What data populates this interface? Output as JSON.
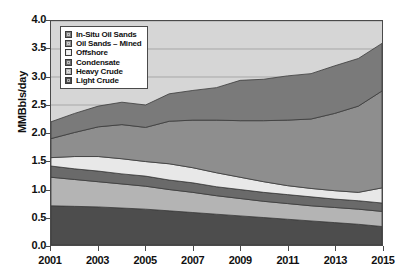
{
  "chart_data": {
    "type": "area",
    "title": "",
    "subtitle": "",
    "xlabel": "",
    "ylabel": "MMBbls/day",
    "stacked": true,
    "grid": true,
    "legend_position": "top-left",
    "xlim": [
      2001,
      2015
    ],
    "ylim": [
      0.0,
      4.0
    ],
    "yticks": [
      "0.0",
      "0.5",
      "1.0",
      "1.5",
      "2.0",
      "2.5",
      "3.0",
      "3.5",
      "4.0"
    ],
    "ytick_values": [
      0.0,
      0.5,
      1.0,
      1.5,
      2.0,
      2.5,
      3.0,
      3.5,
      4.0
    ],
    "x": [
      2001,
      2002,
      2003,
      2004,
      2005,
      2006,
      2007,
      2008,
      2009,
      2010,
      2011,
      2012,
      2013,
      2014,
      2015
    ],
    "xtick_labels": [
      "2001",
      "2003",
      "2005",
      "2007",
      "2009",
      "2011",
      "2013",
      "2015"
    ],
    "xtick_values": [
      2001,
      2003,
      2005,
      2007,
      2009,
      2011,
      2013,
      2015
    ],
    "series": [
      {
        "name": "Light Crude",
        "color": "#4d4d4d",
        "values": [
          0.7,
          0.69,
          0.68,
          0.66,
          0.64,
          0.61,
          0.58,
          0.55,
          0.52,
          0.49,
          0.46,
          0.43,
          0.4,
          0.37,
          0.33
        ]
      },
      {
        "name": "Heavy Crude",
        "color": "#b4b4b4",
        "values": [
          0.51,
          0.48,
          0.45,
          0.43,
          0.41,
          0.38,
          0.36,
          0.33,
          0.31,
          0.29,
          0.28,
          0.27,
          0.27,
          0.27,
          0.27
        ]
      },
      {
        "name": "Condensate",
        "color": "#6a6a6a",
        "values": [
          0.2,
          0.19,
          0.19,
          0.18,
          0.18,
          0.17,
          0.17,
          0.16,
          0.16,
          0.16,
          0.16,
          0.16,
          0.15,
          0.15,
          0.15
        ]
      },
      {
        "name": "Offshore",
        "color": "#e8e8e8",
        "values": [
          0.15,
          0.22,
          0.26,
          0.27,
          0.26,
          0.29,
          0.27,
          0.25,
          0.22,
          0.19,
          0.16,
          0.15,
          0.15,
          0.15,
          0.27
        ]
      },
      {
        "name": "Oil Sands – Mined",
        "color": "#8e8e8e",
        "values": [
          0.34,
          0.43,
          0.53,
          0.61,
          0.61,
          0.76,
          0.85,
          0.94,
          1.01,
          1.09,
          1.17,
          1.24,
          1.38,
          1.54,
          1.73
        ]
      },
      {
        "name": "In-Situ Oil Sands",
        "color": "#7a7a7a",
        "values": [
          0.3,
          0.34,
          0.37,
          0.4,
          0.4,
          0.49,
          0.53,
          0.58,
          0.72,
          0.74,
          0.79,
          0.81,
          0.85,
          0.85,
          0.85
        ]
      }
    ],
    "cumulative_top": [
      2.2,
      2.35,
      2.48,
      2.55,
      2.5,
      2.7,
      2.76,
      2.81,
      2.94,
      2.96,
      3.02,
      3.06,
      3.2,
      3.33,
      3.6
    ],
    "legend": [
      {
        "label": "In-Situ Oil Sands",
        "color": "#7a7a7a"
      },
      {
        "label": "Oil Sands – Mined",
        "color": "#8e8e8e"
      },
      {
        "label": "Offshore",
        "color": "#e8e8e8"
      },
      {
        "label": "Condensate",
        "color": "#6a6a6a"
      },
      {
        "label": "Heavy Crude",
        "color": "#b4b4b4"
      },
      {
        "label": "Light Crude",
        "color": "#4d4d4d"
      }
    ],
    "plot_background": "#d6d6d6",
    "axis_color": "#4a4a4a",
    "gridline_color": "#a8a8a8"
  }
}
